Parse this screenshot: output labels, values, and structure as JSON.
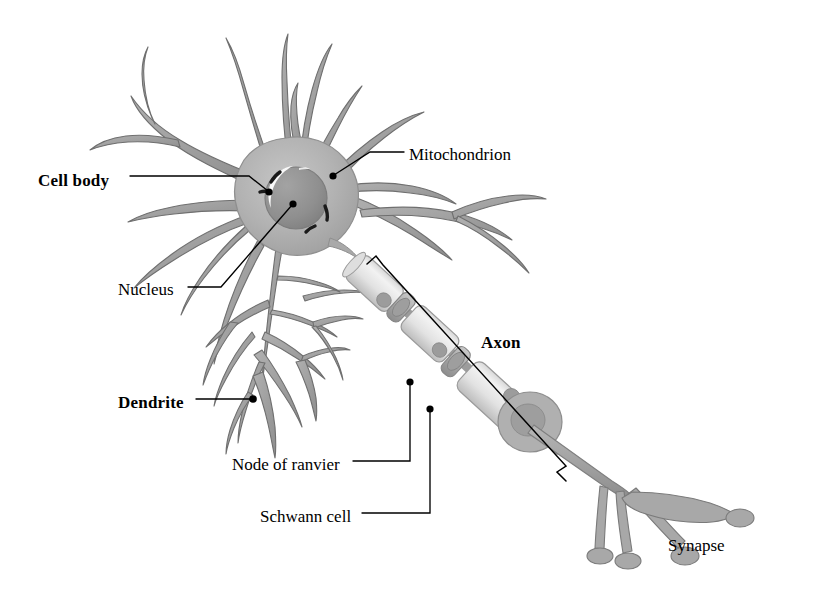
{
  "figure": {
    "background_color": "#ffffff",
    "width": 832,
    "height": 610
  },
  "palette": {
    "soma_fill": "#b3b3b3",
    "soma_edge": "#8f8f8f",
    "nucleus_fill": "#949494",
    "nucleus_edge": "#7d7d7d",
    "nucleus_highlight": "#ffffff",
    "dendrite_fill": "#a8a8a8",
    "dendrite_edge": "#6f6f6f",
    "myelin_fill": "#e6e6e6",
    "myelin_edge": "#9a9a9a",
    "myelin_collar": "#b8b8b8",
    "schwann_nucleus": "#9c9c9c",
    "axon_shaft": "#a0a0a0",
    "terminal_fill": "#a8a8a8",
    "mitochondrion_mark": "#1a1a1a",
    "leader_line": "#000000",
    "label_text": "#000000"
  },
  "labels": [
    {
      "id": "cell-body",
      "text": "Cell body",
      "style": "bold",
      "x": 38,
      "y": 172,
      "leader": "horizontal-then-diagonal-down-right",
      "has_dot": true
    },
    {
      "id": "mitochondrion",
      "text": "Mitochondrion",
      "style": "regular",
      "x": 409,
      "y": 146,
      "leader": "horizontal-then-diagonal-down-left",
      "has_dot": true
    },
    {
      "id": "nucleus",
      "text": "Nucleus",
      "style": "regular",
      "x": 118,
      "y": 281,
      "leader": "horizontal-then-diagonal-up-right",
      "has_dot": true
    },
    {
      "id": "axon",
      "text": "Axon",
      "style": "bold",
      "x": 481,
      "y": 334,
      "leader": "bracket",
      "has_dot": false
    },
    {
      "id": "dendrite",
      "text": "Dendrite",
      "style": "bold",
      "x": 118,
      "y": 394,
      "leader": "horizontal-right",
      "has_dot": true
    },
    {
      "id": "node-of-ranvier",
      "text": "Node of ranvier",
      "style": "regular",
      "x": 232,
      "y": 456,
      "leader": "horizontal-then-vertical-up",
      "has_dot": true
    },
    {
      "id": "schwann-cell",
      "text": "Schwann cell",
      "style": "regular",
      "x": 260,
      "y": 508,
      "leader": "horizontal-then-vertical-up",
      "has_dot": true
    },
    {
      "id": "synapse",
      "text": "Synapse",
      "style": "regular",
      "x": 668,
      "y": 537,
      "leader": "none",
      "has_dot": false
    }
  ],
  "structures": {
    "soma": "cell body with radiating dendrites",
    "nucleus": "dark round nucleus with white crescent highlight",
    "mitochondria_count": 4,
    "myelin_segments": 3,
    "nodes_of_ranvier": 2,
    "schwann_nuclei": 3,
    "terminal_branches": 4
  }
}
